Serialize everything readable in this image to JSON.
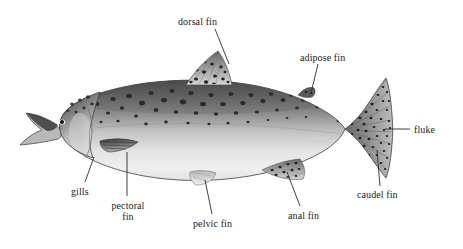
{
  "figure": {
    "view": "left lateral whole-body photograph",
    "background_color": "#ffffff",
    "palette": {
      "dorsal_dark": "#4a4a4a",
      "mid_body_gray": "#9a9a9a",
      "belly_light": "#eeeeee",
      "spot_color": "#2e2e2e",
      "outline": "#3c3c3c",
      "label_text": "#1a1a1a",
      "leader_line": "#2b2b2b"
    }
  },
  "labels": [
    {
      "id": "dorsal-fin",
      "text": "dorsal fin",
      "lines": [
        "dorsal fin"
      ],
      "text_x": 178,
      "text_y": 16,
      "leader": [
        [
          215,
          29
        ],
        [
          229,
          64
        ]
      ]
    },
    {
      "id": "adipose-fin",
      "text": "adipose fin",
      "lines": [
        "adipose fin"
      ],
      "text_x": 300,
      "text_y": 52,
      "leader": [
        [
          318,
          64
        ],
        [
          311,
          93
        ]
      ]
    },
    {
      "id": "fluke",
      "text": "fluke",
      "lines": [
        "fluke"
      ],
      "text_x": 414,
      "text_y": 124,
      "leader": [
        [
          410,
          129
        ],
        [
          385,
          129
        ]
      ]
    },
    {
      "id": "caudel-fin",
      "text": "caudel fin",
      "lines": [
        "caudel fin"
      ],
      "text_x": 357,
      "text_y": 189,
      "leader": [
        [
          380,
          186
        ],
        [
          377,
          150
        ]
      ]
    },
    {
      "id": "anal-fin",
      "text": "anal fin",
      "lines": [
        "anal fin"
      ],
      "text_x": 288,
      "text_y": 210,
      "leader": [
        [
          300,
          206
        ],
        [
          287,
          172
        ]
      ]
    },
    {
      "id": "pelvic-fin",
      "text": "pelvic fin",
      "lines": [
        "pelvic fin"
      ],
      "text_x": 193,
      "text_y": 218,
      "leader": [
        [
          212,
          214
        ],
        [
          205,
          180
        ]
      ]
    },
    {
      "id": "pectoral-fin",
      "text": "pectoral fin",
      "lines": [
        "pectoral",
        "fin"
      ],
      "text_x": 105,
      "text_y": 200,
      "leader": [
        [
          127,
          196
        ],
        [
          127,
          152
        ]
      ]
    },
    {
      "id": "gills",
      "text": "gills",
      "lines": [
        "gills"
      ],
      "text_x": 71,
      "text_y": 186,
      "leader": [
        [
          85,
          182
        ],
        [
          94,
          157
        ]
      ]
    }
  ]
}
